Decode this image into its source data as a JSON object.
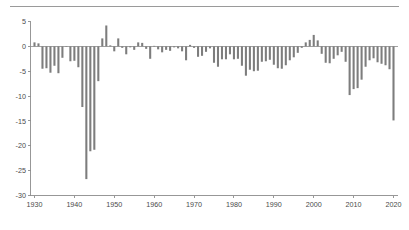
{
  "figure": {
    "title": "",
    "has_top_rule": true,
    "background_color": "#ffffff",
    "bar_color": "#7d7d7d",
    "axis_color": "#8c8c8c",
    "label_color": "#4a4a4a"
  },
  "chart_data": {
    "type": "bar",
    "title": "",
    "subtitle": "",
    "xlabel": "",
    "ylabel": "",
    "xlim": [
      1929,
      2021
    ],
    "ylim": [
      -30,
      5
    ],
    "ytick_values": [
      5,
      0,
      -5,
      -10,
      -15,
      -20,
      -25,
      -30
    ],
    "ytick_labels": [
      "5",
      "0",
      "-5",
      "-10",
      "-15",
      "-20",
      "-25",
      "-30"
    ],
    "xtick_values": [
      1930,
      1940,
      1950,
      1960,
      1970,
      1980,
      1990,
      2000,
      2010,
      2020
    ],
    "xtick_labels": [
      "1930",
      "1940",
      "1950",
      "1960",
      "1970",
      "1980",
      "1990",
      "2000",
      "2010",
      "2020"
    ],
    "grid": false,
    "legend": null,
    "zero_reference_line": true,
    "categories": [
      1930,
      1931,
      1932,
      1933,
      1934,
      1935,
      1936,
      1937,
      1938,
      1939,
      1940,
      1941,
      1942,
      1943,
      1944,
      1945,
      1946,
      1947,
      1948,
      1949,
      1950,
      1951,
      1952,
      1953,
      1954,
      1955,
      1956,
      1957,
      1958,
      1959,
      1960,
      1961,
      1962,
      1963,
      1964,
      1965,
      1966,
      1967,
      1968,
      1969,
      1970,
      1971,
      1972,
      1973,
      1974,
      1975,
      1976,
      1977,
      1978,
      1979,
      1980,
      1981,
      1982,
      1983,
      1984,
      1985,
      1986,
      1987,
      1988,
      1989,
      1990,
      1991,
      1992,
      1993,
      1994,
      1995,
      1996,
      1997,
      1998,
      1999,
      2000,
      2001,
      2002,
      2003,
      2004,
      2005,
      2006,
      2007,
      2008,
      2009,
      2010,
      2011,
      2012,
      2013,
      2014,
      2015,
      2016,
      2017,
      2018,
      2019,
      2020
    ],
    "values": [
      0.8,
      0.6,
      -4.5,
      -4.4,
      -5.3,
      -3.9,
      -5.4,
      -2.3,
      -0.1,
      -3.0,
      -2.9,
      -4.2,
      -12.2,
      -26.7,
      -21.1,
      -20.8,
      -7.0,
      1.6,
      4.2,
      0.2,
      -1.0,
      1.6,
      -0.3,
      -1.6,
      -0.2,
      -0.7,
      0.8,
      0.7,
      -0.5,
      -2.5,
      0.1,
      -0.6,
      -1.2,
      -0.7,
      -0.9,
      -0.2,
      -0.4,
      -1.0,
      -2.8,
      0.3,
      -0.3,
      -2.1,
      -1.9,
      -1.1,
      -0.4,
      -3.3,
      -4.1,
      -2.6,
      -2.6,
      -1.6,
      -2.6,
      -2.5,
      -3.9,
      -5.9,
      -4.7,
      -5.0,
      -4.9,
      -3.1,
      -3.0,
      -2.7,
      -3.7,
      -4.4,
      -4.5,
      -3.8,
      -2.8,
      -2.2,
      -1.3,
      -0.3,
      0.8,
      1.3,
      2.3,
      1.2,
      -1.5,
      -3.3,
      -3.4,
      -2.5,
      -1.8,
      -1.1,
      -3.1,
      -9.8,
      -8.6,
      -8.4,
      -6.7,
      -4.1,
      -2.8,
      -2.4,
      -3.2,
      -3.5,
      -3.8,
      -4.6,
      -14.9
    ],
    "units": "percent of GDP",
    "n_points": 91,
    "max_value": 4.2,
    "max_value_year": 1948,
    "min_value": -26.7,
    "min_value_year": 1943
  }
}
